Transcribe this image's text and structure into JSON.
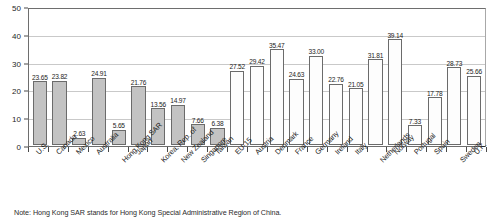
{
  "chart_data": {
    "type": "bar",
    "title": "",
    "xlabel": "",
    "ylabel": "",
    "ylim": [
      0,
      50
    ],
    "yticks": [
      0,
      10,
      20,
      30,
      40,
      50
    ],
    "grid": true,
    "legend": "none",
    "categories": [
      "U.S.",
      "Canada",
      "Mexico",
      "Australia",
      "Hong Kong SAR",
      "Japan",
      "Korea, Rep. of",
      "New Zealand",
      "Singapore",
      "Taiwan",
      "EU-15",
      "Austria",
      "Denmark",
      "France",
      "Germany",
      "Ireland",
      "Italy",
      "Netherlands",
      "Norway",
      "Portugal",
      "Spain",
      "Sweden",
      "U.K."
    ],
    "values": [
      23.65,
      23.82,
      2.63,
      24.91,
      5.65,
      21.76,
      13.56,
      14.97,
      7.66,
      6.38,
      27.52,
      29.42,
      35.47,
      24.63,
      33.0,
      22.76,
      21.05,
      31.81,
      39.14,
      7.33,
      17.78,
      28.73,
      25.66
    ],
    "value_labels": [
      "23.65",
      "23.82",
      "2.63",
      "24.91",
      "5.65",
      "21.76",
      "13.56",
      "14.97",
      "7.66",
      "6.38",
      "27.52",
      "29.42",
      "35.47",
      "24.63",
      "33.00",
      "22.76",
      "21.05",
      "31.81",
      "39.14",
      "7.33",
      "17.78",
      "28.73",
      "25.66"
    ],
    "bar_styles": [
      "filled",
      "filled",
      "filled",
      "filled",
      "filled",
      "filled",
      "filled",
      "filled",
      "filled",
      "filled",
      "hollow",
      "hollow",
      "hollow",
      "hollow",
      "hollow",
      "hollow",
      "hollow",
      "hollow",
      "hollow",
      "hollow",
      "hollow",
      "hollow",
      "hollow"
    ],
    "colors": {
      "bar_fill_filled": "#c3c3c3",
      "bar_fill_hollow": "#fdfdfd",
      "bar_border": "#6b6b6b",
      "gridline": "#c9c9c9",
      "axis": "#6e6e6e",
      "text": "#1c1c1c"
    }
  },
  "note": {
    "text": "Note: Hong Kong SAR stands for Hong Kong Special Administrative Region of China."
  }
}
